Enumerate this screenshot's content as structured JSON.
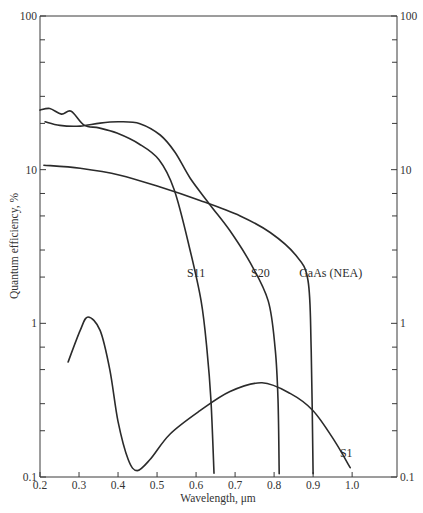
{
  "chart_data": {
    "type": "line",
    "title": "",
    "xlabel": "Wavelength, μm",
    "ylabel": "Quantum efficiency, %",
    "xlim": [
      0.2,
      1.115
    ],
    "ylim": [
      0.1,
      100
    ],
    "yscale": "log",
    "grid": false,
    "legend": "none (curves labeled inline)",
    "x_ticks": [
      0.2,
      0.3,
      0.4,
      0.5,
      0.6,
      0.7,
      0.8,
      0.9,
      1.0
    ],
    "x_tick_labels": [
      "0.2",
      "0.3",
      "0.4",
      "0.5",
      "0.6",
      "0.7",
      "0.8",
      "0.9",
      "1.0"
    ],
    "y_ticks_major": [
      0.1,
      1,
      10,
      100
    ],
    "y_tick_labels_left": [
      "0.1",
      "1",
      "10",
      "100"
    ],
    "y_tick_labels_right": [
      "0.1",
      "1",
      "10",
      "100"
    ],
    "y_ticks_minor": [
      0.2,
      0.3,
      0.5,
      0.7,
      2,
      3,
      5,
      7,
      20,
      30,
      50,
      70
    ],
    "series": [
      {
        "name": "S11",
        "label": "S11",
        "x": [
          0.2,
          0.225,
          0.255,
          0.28,
          0.313,
          0.351,
          0.397,
          0.454,
          0.505,
          0.544,
          0.582,
          0.613,
          0.628,
          0.638,
          0.646
        ],
        "y": [
          24.4,
          25.0,
          23.0,
          24.0,
          19.5,
          18.7,
          17.3,
          14.7,
          11.6,
          7.4,
          3.2,
          1.4,
          0.67,
          0.32,
          0.106
        ]
      },
      {
        "name": "S20",
        "label": "S20",
        "x": [
          0.213,
          0.251,
          0.303,
          0.354,
          0.405,
          0.456,
          0.508,
          0.546,
          0.585,
          0.636,
          0.687,
          0.738,
          0.785,
          0.803,
          0.81,
          0.813
        ],
        "y": [
          20.5,
          19.4,
          19.2,
          20.1,
          20.5,
          19.9,
          16.8,
          13.0,
          8.8,
          5.9,
          4.0,
          2.5,
          1.4,
          0.67,
          0.32,
          0.105
        ]
      },
      {
        "name": "GaAs (NEA)",
        "label": "GaAs (NEA)",
        "x": [
          0.21,
          0.303,
          0.405,
          0.508,
          0.61,
          0.713,
          0.79,
          0.854,
          0.887,
          0.895,
          0.9
        ],
        "y": [
          10.7,
          10.2,
          9.2,
          7.7,
          6.3,
          5.0,
          3.9,
          2.8,
          1.9,
          0.67,
          0.105
        ]
      },
      {
        "name": "S1",
        "label": "S1",
        "x": [
          0.272,
          0.303,
          0.323,
          0.354,
          0.379,
          0.4,
          0.426,
          0.449,
          0.482,
          0.533,
          0.61,
          0.687,
          0.769,
          0.841,
          0.9,
          0.956,
          0.995
        ],
        "y": [
          0.56,
          0.9,
          1.1,
          0.9,
          0.5,
          0.23,
          0.13,
          0.11,
          0.13,
          0.19,
          0.27,
          0.36,
          0.41,
          0.35,
          0.27,
          0.17,
          0.115
        ]
      }
    ],
    "annotations": [
      {
        "text": "S11",
        "series": "S11",
        "x": 0.6,
        "y": 2.0
      },
      {
        "text": "S20",
        "series": "S20",
        "x": 0.765,
        "y": 2.0
      },
      {
        "text": "GaAs (NEA)",
        "series": "GaAs (NEA)",
        "x": 0.945,
        "y": 2.0
      },
      {
        "text": "S1",
        "series": "S1",
        "x": 0.985,
        "y": 0.135
      }
    ]
  }
}
